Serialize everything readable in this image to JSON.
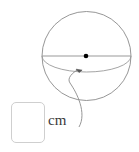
{
  "figure": {
    "name": "sphere-radius-diagram",
    "shape": "sphere",
    "stroke_color": "#8a8a8a",
    "equator_color": "#9a9a9a",
    "diameter_color": "#9a9a9a",
    "center_dot_color": "#000000",
    "leader_color": "#8a8a8a",
    "circle": {
      "cx": 86.5,
      "cy": 56,
      "r": 44.5
    },
    "center_dot": {
      "cx": 86,
      "cy": 56,
      "r": 2.2
    },
    "diameter_line": {
      "x1": 42,
      "y1": 56,
      "x2": 131,
      "y2": 56
    },
    "equator_arc": {
      "rx": 44.5,
      "ry": 16,
      "from_x": 42,
      "from_y": 56,
      "to_x": 131,
      "to_y": 56
    },
    "arrow_tip": {
      "x": 77,
      "y": 69
    },
    "leader_path": "M 79 126 C 86 112, 76 92, 70 82 C 67 77, 73 72, 78 70"
  },
  "answer_input": {
    "value": "",
    "placeholder": ""
  },
  "unit": {
    "label": "cm"
  }
}
